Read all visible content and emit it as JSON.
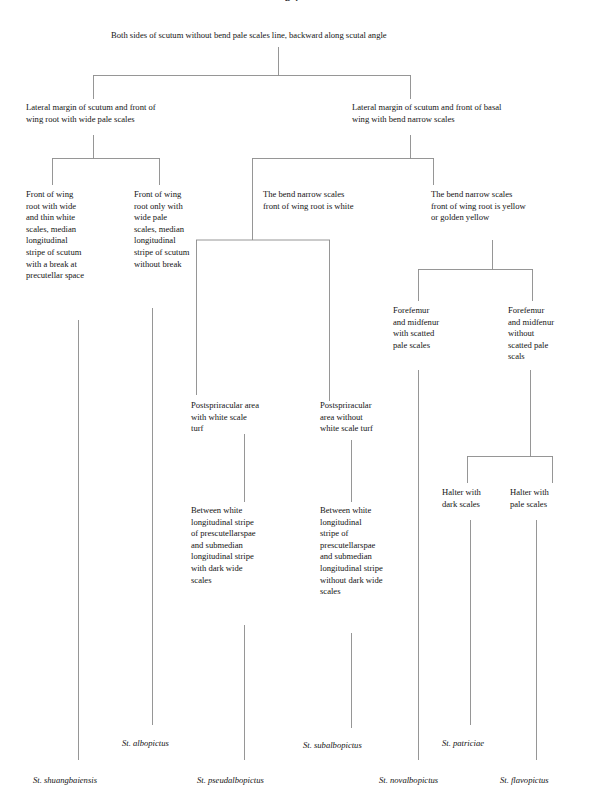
{
  "page": {
    "width": 595,
    "height": 801,
    "background": "#ffffff",
    "line_color": "#8a8a8a",
    "text_color": "#141414",
    "title_fragment": "p 2"
  },
  "root": {
    "text": "Both sides of scutum without bend pale scales line, backward along scutal angle"
  },
  "level1": {
    "left": "Lateral margin of scutum and front of\nwing root with wide pale scales",
    "right": "Lateral margin of scutum and front of basal\nwing with bend narrow scales"
  },
  "level2": {
    "a": "Front of wing\nroot with wide\nand thin white\nscales, median\nlongitudinal\nstripe of scutum\nwith a break at\nprecutellar space",
    "b": "Front of wing\nroot only with\nwide pale\nscales, median\nlongitudinal\nstripe of scutum\nwithout break",
    "c": "The bend narrow scales\nfront of wing root is white",
    "d": "The bend narrow scales\nfront of wing root is yellow\nor golden yellow"
  },
  "level3": {
    "forefemur_with": "Forefemur\nand midfenur\nwith scatted\npale scales",
    "forefemur_without": "Forefemur\nand midfenur\nwithout\nscatted pale\nscals"
  },
  "level4": {
    "postspiracular_with": "Postspriracular area\nwith white scale\nturf",
    "postspiracular_without": "Postspriracular\narea without\nwhite scale turf"
  },
  "level5": {
    "between_with": "Between white\nlongitudinal stripe\nof prescutellarspae\nand submedian\nlongitudinal stripe\nwith dark wide\nscales",
    "between_without": "Between white\nlongitudinal\nstripe of\nprescutellarspae\nand submedian\nlongitudinal stripe\nwithout dark wide\nscales",
    "halter_dark": "Halter with\ndark scales",
    "halter_pale": "Halter with\npale scales"
  },
  "species": {
    "albopictus": "St. albopictus",
    "subalbopictus": "St. subalbopictus",
    "patriciae": "St. patriciae",
    "shuangbaiensis": "St. shuangbaiensis",
    "pseudalbopictus": "St. pseudalbopictus",
    "novalbopictus": "St. novalbopictus",
    "flavopictus": "St. flavopictus"
  }
}
